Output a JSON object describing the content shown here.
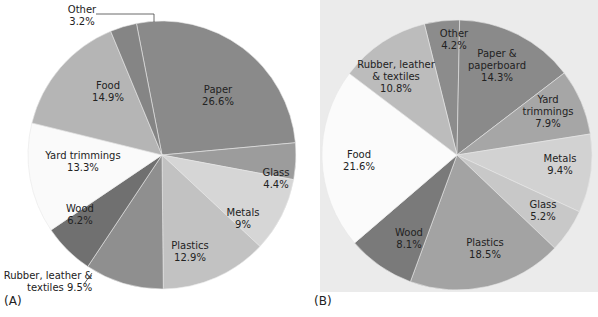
{
  "chart_data": [
    {
      "type": "pie",
      "panel_label": "(A)",
      "title": "",
      "start_angle_deg": -11,
      "direction": "clockwise",
      "categories": [
        "Paper",
        "Glass",
        "Metals",
        "Plastics",
        "Rubber, leather & textiles",
        "Wood",
        "Yard trimmings",
        "Food",
        "Other"
      ],
      "values": [
        26.6,
        4.4,
        9,
        12.9,
        9.5,
        6.2,
        13.3,
        14.9,
        3.2
      ],
      "value_labels": [
        "26.6%",
        "4.4%",
        "9%",
        "12.9%",
        "9.5%",
        "6.2%",
        "13.3%",
        "14.9%",
        "3.2%"
      ],
      "colors": [
        "#8a8a8a",
        "#9c9c9c",
        "#d6d6d6",
        "#c2c2c2",
        "#8f8f8f",
        "#707070",
        "#fafafa",
        "#b5b5b5",
        "#858585"
      ],
      "legend": "none (labels on slices)"
    },
    {
      "type": "pie",
      "panel_label": "(B)",
      "title": "",
      "start_angle_deg": -14,
      "direction": "clockwise",
      "categories": [
        "Other",
        "Paper & paperboard",
        "Yard trimmings",
        "Metals",
        "Glass",
        "Plastics",
        "Wood",
        "Food",
        "Rubber, leather & textiles"
      ],
      "values": [
        4.2,
        14.3,
        7.9,
        9.4,
        5.2,
        18.5,
        8.1,
        21.6,
        10.8
      ],
      "value_labels": [
        "4.2%",
        "14.3%",
        "7.9%",
        "9.4%",
        "5.2%",
        "18.5%",
        "8.1%",
        "21.6%",
        "10.8%"
      ],
      "colors": [
        "#8c8c8c",
        "#8a8a8a",
        "#a6a6a6",
        "#d2d2d2",
        "#c8c8c8",
        "#a3a3a3",
        "#7a7a7a",
        "#fbfbfb",
        "#bcbcbc"
      ],
      "legend": "none (labels on slices)"
    }
  ],
  "panelA": {
    "tag": "(A)",
    "labels": [
      {
        "name": "Paper",
        "l1": "Paper",
        "l2": "26.6%"
      },
      {
        "name": "Glass",
        "l1": "Glass",
        "l2": "4.4%"
      },
      {
        "name": "Metals",
        "l1": "Metals",
        "l2": "9%"
      },
      {
        "name": "Plastics",
        "l1": "Plastics",
        "l2": "12.9%"
      },
      {
        "name": "Rubber",
        "l1": "Rubber, leather &",
        "l2": "textiles 9.5%"
      },
      {
        "name": "Wood",
        "l1": "Wood",
        "l2": "6.2%"
      },
      {
        "name": "Yard",
        "l1": "Yard trimmings",
        "l2": "13.3%"
      },
      {
        "name": "Food",
        "l1": "Food",
        "l2": "14.9%"
      },
      {
        "name": "Other",
        "l1": "Other",
        "l2": "3.2%"
      }
    ]
  },
  "panelB": {
    "tag": "(B)",
    "labels": [
      {
        "name": "Other",
        "l1": "Other",
        "l2": "4.2%"
      },
      {
        "name": "Paper",
        "l1": "Paper &",
        "l2": "paperboard",
        "l3": "14.3%"
      },
      {
        "name": "Yard",
        "l1": "Yard",
        "l2": "trimmings",
        "l3": "7.9%"
      },
      {
        "name": "Metals",
        "l1": "Metals",
        "l2": "9.4%"
      },
      {
        "name": "Glass",
        "l1": "Glass",
        "l2": "5.2%"
      },
      {
        "name": "Plastics",
        "l1": "Plastics",
        "l2": "18.5%"
      },
      {
        "name": "Wood",
        "l1": "Wood",
        "l2": "8.1%"
      },
      {
        "name": "Food",
        "l1": "Food",
        "l2": "21.6%"
      },
      {
        "name": "Rubber",
        "l1": "Rubber, leather",
        "l2": "& textiles",
        "l3": "10.8%"
      }
    ]
  }
}
